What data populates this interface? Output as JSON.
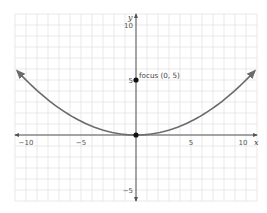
{
  "chart_data": {
    "type": "line",
    "title": "",
    "xlabel": "x",
    "ylabel": "y",
    "xlim": [
      -11,
      11
    ],
    "ylim": [
      -6,
      11
    ],
    "grid": true,
    "x_ticks": [
      -10,
      -5,
      5,
      10
    ],
    "y_ticks": [
      10,
      5,
      -5
    ],
    "x_tick_labels": [
      "−10",
      "−5",
      "5",
      "10"
    ],
    "y_tick_labels": [
      "10",
      "5",
      "−5"
    ],
    "series": [
      {
        "name": "parabola",
        "equation": "y = x^2 / 20",
        "x": [
          -10.8,
          -10,
          -8,
          -6,
          -4,
          -2,
          0,
          2,
          4,
          6,
          8,
          10,
          10.8
        ],
        "values": [
          5.83,
          5,
          3.2,
          1.8,
          0.8,
          0.2,
          0,
          0.2,
          0.8,
          1.8,
          3.2,
          5,
          5.83
        ],
        "color": "#6b6b6b",
        "arrows_at_ends": true
      }
    ],
    "points": [
      {
        "name": "focus",
        "x": 0,
        "y": 5,
        "label": "focus (0, 5)"
      },
      {
        "name": "vertex",
        "x": 0,
        "y": 0,
        "label": ""
      }
    ],
    "annotations": [
      "focus (0, 5)"
    ],
    "colors": {
      "grid": "#e3e3e3",
      "axis": "#555555",
      "curve": "#6b6b6b",
      "point": "#111111"
    }
  }
}
